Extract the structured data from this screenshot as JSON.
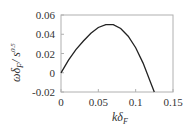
{
  "chart_data": {
    "type": "line",
    "title": "",
    "xlabel": "kδ_F",
    "ylabel": "ωδ_F / s^0.5",
    "xlim": [
      0,
      0.15
    ],
    "ylim": [
      -0.02,
      0.06
    ],
    "xticks": [
      "0",
      "0.05",
      "0.1",
      "0.15"
    ],
    "yticks": [
      "0.06",
      "0.04",
      "0.02",
      "0",
      "-0.02"
    ],
    "grid": false,
    "legend": null,
    "series": [
      {
        "name": "growth rate",
        "x": [
          0,
          0.01,
          0.02,
          0.03,
          0.04,
          0.05,
          0.06,
          0.07,
          0.08,
          0.09,
          0.1,
          0.11,
          0.12,
          0.125
        ],
        "y": [
          0,
          0.013,
          0.024,
          0.033,
          0.041,
          0.047,
          0.05,
          0.05,
          0.046,
          0.038,
          0.026,
          0.01,
          -0.01,
          -0.02
        ]
      }
    ]
  },
  "axes": {
    "x_label_main": "kδ",
    "x_label_sub": "F",
    "y_label_main": "ωδ",
    "y_label_sub": "F",
    "y_label_denom": "/ s",
    "y_label_sup": "0.5"
  }
}
